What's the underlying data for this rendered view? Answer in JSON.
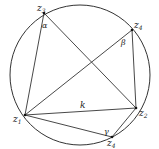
{
  "diagram": {
    "title": "",
    "circle": {
      "cx": 80,
      "cy": 75,
      "r": 70,
      "stroke": "#333333"
    },
    "points": [
      {
        "id": "z1",
        "label": "z",
        "sub": "1",
        "x": 25,
        "y": 115,
        "lx": 12,
        "ly": 123
      },
      {
        "id": "z2",
        "label": "z",
        "sub": "2",
        "x": 136,
        "y": 108,
        "lx": 139,
        "ly": 116
      },
      {
        "id": "z3",
        "label": "z",
        "sub": "3",
        "x": 44,
        "y": 13,
        "lx": 37,
        "ly": 11
      },
      {
        "id": "z4top",
        "label": "z",
        "sub": "4",
        "x": 132,
        "y": 30,
        "lx": 134,
        "ly": 28
      },
      {
        "id": "z4bottom",
        "label": "z",
        "sub": "4",
        "x": 112,
        "y": 137,
        "lx": 107,
        "ly": 147
      }
    ],
    "segments": [
      [
        "z1",
        "z3"
      ],
      [
        "z3",
        "z2"
      ],
      [
        "z1",
        "z4top"
      ],
      [
        "z4top",
        "z2"
      ],
      [
        "z1",
        "z2"
      ],
      [
        "z1",
        "z4bottom"
      ],
      [
        "z4bottom",
        "z2"
      ]
    ],
    "angles": [
      {
        "symbol": "α",
        "x": 43,
        "y": 27
      },
      {
        "symbol": "β",
        "x": 122,
        "y": 44
      },
      {
        "symbol": "γ",
        "x": 105,
        "y": 134
      }
    ],
    "chord_label": {
      "symbol": "k",
      "x": 82,
      "y": 106
    }
  }
}
